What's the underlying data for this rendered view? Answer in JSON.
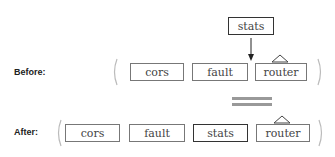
{
  "before": {
    "label": "Before:",
    "incoming": "stats",
    "items": [
      "cors",
      "fault",
      "router"
    ]
  },
  "after": {
    "label": "After:",
    "items": [
      "cors",
      "fault",
      "stats",
      "router"
    ],
    "highlighted": "stats"
  },
  "colors": {
    "border": "#777777",
    "highlight_border": "#333333",
    "equals": "#999999"
  }
}
